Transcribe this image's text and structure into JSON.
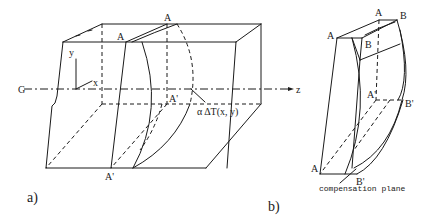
{
  "figure_a": {
    "caption": "a)",
    "labels": {
      "axis_G": "G",
      "axis_z": "z",
      "axis_x": "x",
      "axis_y": "y",
      "point_A_front": "A",
      "point_A_back": "A",
      "point_A_prime_mid": "A'",
      "point_A_prime_bottom": "A'",
      "deformation": "α ΔT(x, y)"
    }
  },
  "figure_b": {
    "caption": "b)",
    "labels": {
      "point_A_left": "A",
      "point_A_top": "A",
      "point_B_top": "B",
      "point_B_inner": "B",
      "point_A_prime": "A'",
      "point_B_prime_mid": "B'",
      "point_A_bottom": "A",
      "point_B_prime_bottom": "B'",
      "compensation_plane": "compensation plane"
    }
  },
  "colors": {
    "line": "#1a1a1a",
    "background": "#ffffff"
  }
}
